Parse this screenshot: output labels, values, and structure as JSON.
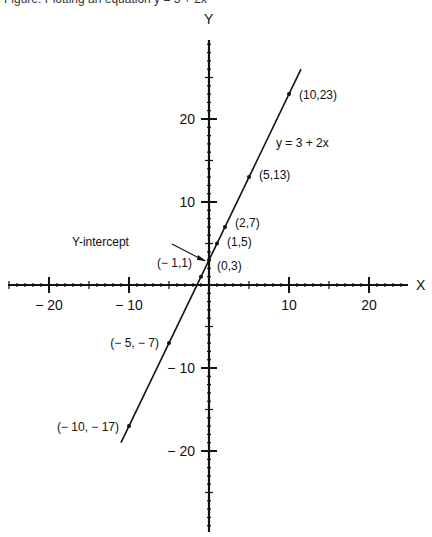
{
  "caption": "Figure: Plotting an equation y = 3 + 2x",
  "chart_data": {
    "type": "line",
    "title": "",
    "equation": "y = 3 + 2x",
    "xlabel": "X",
    "ylabel": "Y",
    "xlim": [
      -25,
      25
    ],
    "ylim": [
      -30,
      30
    ],
    "x_ticks": [
      -20,
      -10,
      10,
      20
    ],
    "y_ticks": [
      -20,
      -10,
      10,
      20
    ],
    "x_tick_labels": [
      "− 20",
      "− 10",
      "10",
      "20"
    ],
    "y_tick_labels": [
      "− 20",
      "− 10",
      "10",
      "20"
    ],
    "grid": false,
    "line_segment": {
      "x_start": -11,
      "y_start": -19,
      "x_end": 11.5,
      "y_end": 26
    },
    "points": [
      {
        "x": -10,
        "y": -17,
        "label": "(− 10, − 17)"
      },
      {
        "x": -5,
        "y": -7,
        "label": "(− 5, − 7)"
      },
      {
        "x": -1,
        "y": 1,
        "label": "(− 1,1)"
      },
      {
        "x": 0,
        "y": 3,
        "label": "(0,3)"
      },
      {
        "x": 1,
        "y": 5,
        "label": "(1,5)"
      },
      {
        "x": 2,
        "y": 7,
        "label": "(2,7)"
      },
      {
        "x": 5,
        "y": 13,
        "label": "(5,13)"
      },
      {
        "x": 10,
        "y": 23,
        "label": "(10,23)"
      }
    ],
    "annotations": [
      {
        "text": "Y-intercept",
        "points_to": {
          "x": 0,
          "y": 3
        }
      },
      {
        "text": "y = 3 + 2x",
        "position": {
          "x": 8,
          "y": 17
        }
      }
    ]
  }
}
